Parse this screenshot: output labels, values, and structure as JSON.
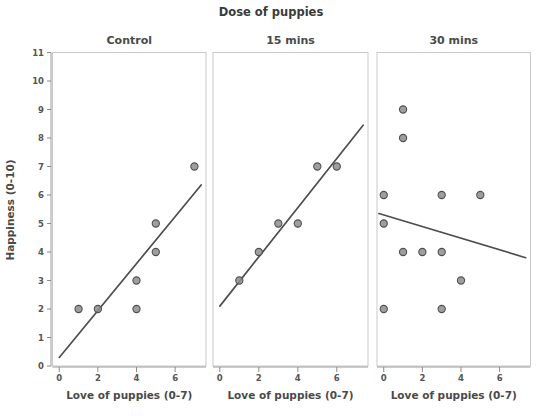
{
  "chart_data": {
    "type": "scatter",
    "title": "Dose of puppies",
    "xlabel": "Love of puppies (0-7)",
    "ylabel": "Happiness (0-10)",
    "xlim": [
      -0.35,
      7.6
    ],
    "ylim": [
      0,
      11
    ],
    "xticks": [
      0,
      2,
      4,
      6
    ],
    "xtick_labels": [
      "0",
      "2",
      "4",
      "6"
    ],
    "yticks": [
      0,
      1,
      2,
      3,
      4,
      5,
      6,
      7,
      8,
      9,
      10,
      11
    ],
    "ytick_labels": [
      "0",
      "1",
      "2",
      "3",
      "4",
      "5",
      "6",
      "7",
      "8",
      "9",
      "10",
      "11"
    ],
    "grid": false,
    "legend": "none",
    "marker_color": "#8d8d8d",
    "marker_edge_color": "#4f4f4f",
    "line_color": "#4e4e4e",
    "panel_border_color": "#c9c9c9",
    "panels": [
      {
        "label": "Control",
        "points": [
          {
            "x": 1,
            "y": 2
          },
          {
            "x": 2,
            "y": 2
          },
          {
            "x": 4,
            "y": 2
          },
          {
            "x": 4,
            "y": 3
          },
          {
            "x": 5,
            "y": 4
          },
          {
            "x": 5,
            "y": 5
          },
          {
            "x": 7,
            "y": 7
          }
        ],
        "fit_line": {
          "x0": 0,
          "y0": 0.3,
          "x1": 7.35,
          "y1": 6.35
        }
      },
      {
        "label": "15 mins",
        "points": [
          {
            "x": 1,
            "y": 3
          },
          {
            "x": 2,
            "y": 4
          },
          {
            "x": 3,
            "y": 5
          },
          {
            "x": 4,
            "y": 5
          },
          {
            "x": 5,
            "y": 7
          },
          {
            "x": 6,
            "y": 7
          }
        ],
        "fit_line": {
          "x0": 0,
          "y0": 2.1,
          "x1": 7.35,
          "y1": 8.45
        }
      },
      {
        "label": "30 mins",
        "points": [
          {
            "x": 1,
            "y": 9
          },
          {
            "x": 1,
            "y": 8
          },
          {
            "x": 0,
            "y": 6
          },
          {
            "x": 3,
            "y": 6
          },
          {
            "x": 5,
            "y": 6
          },
          {
            "x": 0,
            "y": 5
          },
          {
            "x": 1,
            "y": 4
          },
          {
            "x": 2,
            "y": 4
          },
          {
            "x": 3,
            "y": 4
          },
          {
            "x": 4,
            "y": 3
          },
          {
            "x": 0,
            "y": 2
          },
          {
            "x": 3,
            "y": 2
          }
        ],
        "fit_line": {
          "x0": -0.25,
          "y0": 5.35,
          "x1": 7.35,
          "y1": 3.8
        }
      }
    ]
  }
}
